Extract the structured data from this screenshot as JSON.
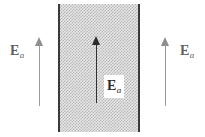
{
  "figure": {
    "name": "electric-field-slab-diagram",
    "background_color": "#ffffff",
    "width": 205,
    "height": 137
  },
  "slab": {
    "name": "hatched-dielectric-slab",
    "fill_pattern": "stipple-checker",
    "fill_color": "#b4b4b4",
    "edge_color": "#3a3a3a",
    "left_edge_x": 58,
    "right_edge_x": 138,
    "top_y": 4,
    "bottom_y": 132
  },
  "arrows": [
    {
      "name": "left-field-arrow",
      "direction": "up",
      "color": "#8d8d8d",
      "region": "outside-left"
    },
    {
      "name": "center-field-arrow",
      "direction": "up",
      "color": "#2b2b2b",
      "region": "inside-slab"
    },
    {
      "name": "right-field-arrow",
      "direction": "up",
      "color": "#8d8d8d",
      "region": "outside-right"
    }
  ],
  "labels": {
    "left": {
      "base": "E",
      "subscript": "a",
      "color": "#5f5f5f"
    },
    "center": {
      "base": "E",
      "subscript": "a",
      "color": "#2b2b2b"
    },
    "right": {
      "base": "E",
      "subscript": "a",
      "color": "#5f5f5f"
    }
  }
}
